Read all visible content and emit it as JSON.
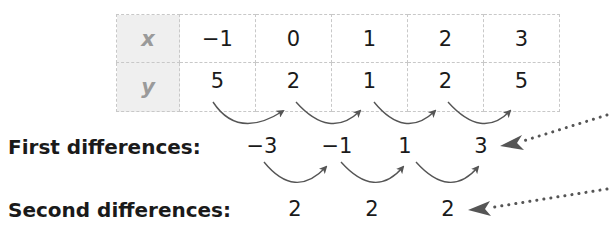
{
  "table": {
    "rows": [
      {
        "header": "x",
        "values": [
          "−1",
          "0",
          "1",
          "2",
          "3"
        ]
      },
      {
        "header": "y",
        "values": [
          "5",
          "2",
          "1",
          "2",
          "5"
        ]
      }
    ]
  },
  "first_differences": {
    "label": "First differences:",
    "values": [
      "−3",
      "−1",
      "1",
      "3"
    ]
  },
  "second_differences": {
    "label": "Second differences:",
    "values": [
      "2",
      "2",
      "2"
    ]
  },
  "colors": {
    "header_bg": "#efefef",
    "header_text": "#9a9a9a",
    "arrow": "#555555",
    "grid": "#c8c8c8"
  }
}
